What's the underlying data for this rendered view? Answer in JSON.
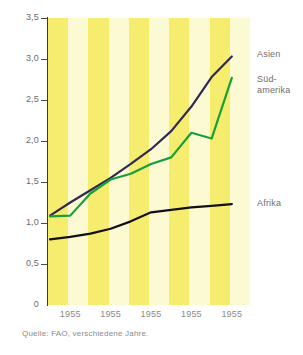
{
  "chart_data": {
    "type": "line",
    "title": "",
    "subtitle": "",
    "xlabel": "",
    "ylabel": "Tonnen pro Hektar",
    "ylim": [
      0,
      3.5
    ],
    "xlim": [
      0,
      5
    ],
    "grid": false,
    "legend_position": "right-inline",
    "y_ticks": [
      "0",
      "0,5",
      "1,0",
      "1,5",
      "2,0",
      "2,5",
      "3,0",
      "3,5"
    ],
    "y_tick_values": [
      0,
      0.5,
      1.0,
      1.5,
      2.0,
      2.5,
      3.0,
      3.5
    ],
    "x_tick_labels": [
      "1955",
      "1955",
      "1955",
      "1955",
      "1955"
    ],
    "x_tick_positions": [
      0.55,
      1.55,
      2.55,
      3.55,
      4.55
    ],
    "background_bands": {
      "count": 5,
      "dark": "#F6ED6E",
      "light": "#FCFAD2"
    },
    "series": [
      {
        "name": "Asien",
        "color": "#2E2A52",
        "x": [
          0.05,
          0.55,
          1.05,
          1.55,
          2.05,
          2.55,
          3.05,
          3.55,
          4.05,
          4.55
        ],
        "values": [
          1.09,
          1.25,
          1.4,
          1.55,
          1.72,
          1.9,
          2.12,
          2.42,
          2.78,
          3.03
        ]
      },
      {
        "name": "Süd-amerika",
        "color": "#17A03A",
        "x": [
          0.05,
          0.55,
          1.05,
          1.55,
          2.05,
          2.55,
          3.05,
          3.55,
          4.05,
          4.55
        ],
        "values": [
          1.08,
          1.09,
          1.36,
          1.53,
          1.6,
          1.72,
          1.8,
          2.1,
          2.03,
          2.77
        ]
      },
      {
        "name": "Afrika",
        "color": "#111111",
        "x": [
          0.05,
          0.55,
          1.05,
          1.55,
          2.05,
          2.55,
          3.05,
          3.55,
          4.05,
          4.55
        ],
        "values": [
          0.8,
          0.83,
          0.87,
          0.93,
          1.02,
          1.13,
          1.16,
          1.19,
          1.21,
          1.23
        ]
      }
    ]
  },
  "labels": {
    "asien": "Asien",
    "suedamerika_line1": "Süd-",
    "suedamerika_line2": "amerika",
    "afrika": "Afrika"
  },
  "source": {
    "note": "Quelle: FAO, verschiedene Jahre."
  }
}
